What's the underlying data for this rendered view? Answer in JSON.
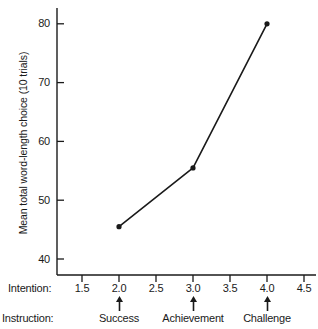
{
  "chart_data": {
    "type": "line",
    "title": "",
    "xlabel": "Intention:",
    "ylabel": "Mean total word-length choice (10 trials)",
    "x": [
      2.0,
      3.0,
      4.0
    ],
    "values": [
      45.5,
      55.5,
      80.0
    ],
    "series": [
      {
        "name": "Mean total word-length choice",
        "x": [
          2.0,
          3.0,
          4.0
        ],
        "values": [
          45.5,
          55.5,
          80.0
        ]
      }
    ],
    "point_labels": [
      "Success",
      "Achievement",
      "Challenge"
    ],
    "xlim": [
      1.25,
      4.75
    ],
    "ylim": [
      34,
      94
    ],
    "xticks": [
      "1.5",
      "2.0",
      "2.5",
      "3.0",
      "3.5",
      "4.0",
      "4.5"
    ],
    "xtick_values": [
      1.5,
      2.0,
      2.5,
      3.0,
      3.5,
      4.0,
      4.5
    ],
    "yticks": [
      "40",
      "50",
      "60",
      "70",
      "80",
      "90"
    ],
    "ytick_values": [
      40,
      50,
      60,
      70,
      80,
      90
    ],
    "grid": false,
    "legend": "none",
    "line_color": "#1a1a1a",
    "marker": "circle",
    "marker_color": "#1a1a1a"
  },
  "axes": {
    "y_title": "Mean total word-length choice (10 trials)",
    "y_ticks": [
      {
        "label": "90",
        "value": 90
      },
      {
        "label": "80",
        "value": 80
      },
      {
        "label": "70",
        "value": 70
      },
      {
        "label": "60",
        "value": 60
      },
      {
        "label": "50",
        "value": 50
      },
      {
        "label": "40",
        "value": 40
      }
    ],
    "x_ticks": [
      {
        "label": "1.5",
        "value": 1.5
      },
      {
        "label": "2.0",
        "value": 2.0
      },
      {
        "label": "2.5",
        "value": 2.5
      },
      {
        "label": "3.0",
        "value": 3.0
      },
      {
        "label": "3.5",
        "value": 3.5
      },
      {
        "label": "4.0",
        "value": 4.0
      },
      {
        "label": "4.5",
        "value": 4.5
      }
    ]
  },
  "rows": {
    "intention_label": "Intention:",
    "instruction_label": "Instruction:",
    "instructions": [
      {
        "label": "Success",
        "value": 2.0
      },
      {
        "label": "Achievement",
        "value": 3.0
      },
      {
        "label": "Challenge",
        "value": 4.0
      }
    ]
  }
}
